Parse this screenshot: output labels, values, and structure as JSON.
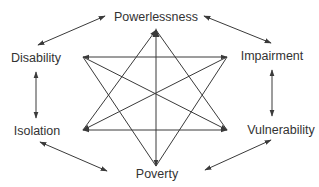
{
  "diagram": {
    "nodes": [
      {
        "id": "powerlessness",
        "label": "Powerlessness",
        "x": 156,
        "y": 17
      },
      {
        "id": "impairment",
        "label": "Impairment",
        "x": 270,
        "y": 56
      },
      {
        "id": "vulnerability",
        "label": "Vulnerability",
        "x": 278,
        "y": 129
      },
      {
        "id": "poverty",
        "label": "Poverty",
        "x": 157,
        "y": 173
      },
      {
        "id": "isolation",
        "label": "Isolation",
        "x": 37,
        "y": 131
      },
      {
        "id": "disability",
        "label": "Disability",
        "x": 35,
        "y": 58
      }
    ],
    "outer_cycle": [
      {
        "from": "powerlessness",
        "to": "impairment",
        "bidirectional": true
      },
      {
        "from": "impairment",
        "to": "vulnerability",
        "bidirectional": true
      },
      {
        "from": "vulnerability",
        "to": "poverty",
        "bidirectional": true
      },
      {
        "from": "poverty",
        "to": "isolation",
        "bidirectional": true
      },
      {
        "from": "isolation",
        "to": "disability",
        "bidirectional": true
      },
      {
        "from": "disability",
        "to": "powerlessness",
        "bidirectional": true
      }
    ],
    "inner_star_points": {
      "top": [
        156,
        30
      ],
      "upper_left": [
        83,
        57
      ],
      "upper_right": [
        227,
        57
      ],
      "lower_left": [
        83,
        130
      ],
      "lower_right": [
        227,
        130
      ],
      "bottom": [
        156,
        166
      ]
    },
    "inner_edges": [
      [
        "top",
        "lower_left"
      ],
      [
        "top",
        "lower_right"
      ],
      [
        "top",
        "bottom"
      ],
      [
        "upper_left",
        "upper_right"
      ],
      [
        "upper_left",
        "lower_right"
      ],
      [
        "upper_left",
        "bottom"
      ],
      [
        "upper_right",
        "lower_left"
      ],
      [
        "upper_right",
        "bottom"
      ],
      [
        "lower_left",
        "lower_right"
      ]
    ]
  }
}
